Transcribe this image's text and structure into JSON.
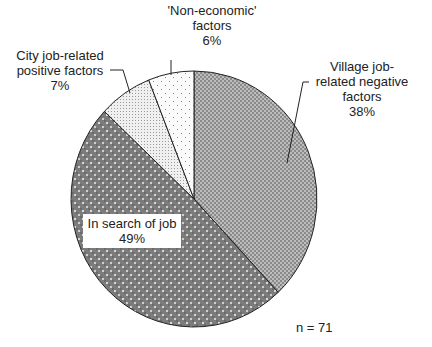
{
  "chart_data": {
    "type": "pie",
    "title": "",
    "categories": [
      "Village job-related negative factors",
      "In search of job",
      "City job-related positive factors",
      "'Non-economic' factors"
    ],
    "values": [
      38,
      49,
      7,
      6
    ],
    "units": "%",
    "start_angle_deg": 0,
    "direction": "clockwise",
    "annotation": "n = 71",
    "legend": "none (direct labels)"
  },
  "labels": {
    "village": {
      "line1": "Village job-",
      "line2": "related negative",
      "line3": "factors",
      "pct": "38%"
    },
    "search": {
      "line1": "In search of job",
      "pct": "49%"
    },
    "city": {
      "line1": "City job-related",
      "line2": "positive factors",
      "pct": "7%"
    },
    "noneco": {
      "line1": "'Non-economic'",
      "line2": "factors",
      "pct": "6%"
    },
    "n": "n = 71"
  },
  "colors": {
    "village": "#a8a8a8",
    "search": "#7a7a7a",
    "city": "#e4e4e4",
    "noneco": "#f4f4f4",
    "outline": "#222222"
  }
}
